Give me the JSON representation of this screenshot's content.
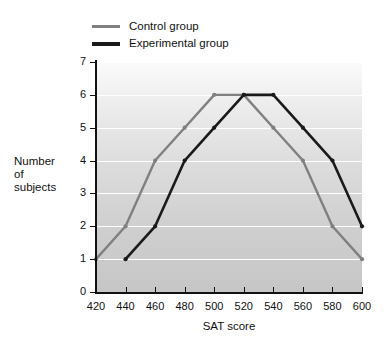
{
  "legend": {
    "position": "top-left",
    "entries": [
      {
        "label": "Control group",
        "color": "#808080",
        "key": "control"
      },
      {
        "label": "Experimental group",
        "color": "#1a1a1a",
        "key": "experimental"
      }
    ]
  },
  "axes": {
    "x_title": "SAT score",
    "y_title_line1": "Number",
    "y_title_line2": "of",
    "y_title_line3": "subjects",
    "x_ticks": [
      "420",
      "440",
      "460",
      "480",
      "500",
      "520",
      "540",
      "560",
      "580",
      "600"
    ],
    "y_ticks": [
      "0",
      "1",
      "2",
      "3",
      "4",
      "5",
      "6",
      "7"
    ]
  },
  "chart_data": {
    "type": "line",
    "title": "",
    "subtitle": "",
    "xlabel": "SAT score",
    "ylabel": "Number of subjects",
    "x": [
      420,
      440,
      460,
      480,
      500,
      520,
      540,
      560,
      580,
      600
    ],
    "xlim": [
      420,
      600
    ],
    "ylim": [
      0,
      7
    ],
    "xticks": [
      420,
      440,
      460,
      480,
      500,
      520,
      540,
      560,
      580,
      600
    ],
    "yticks": [
      0,
      1,
      2,
      3,
      4,
      5,
      6,
      7
    ],
    "grid": "horizontal-only",
    "legend_position": "above-plot-left",
    "series": [
      {
        "name": "Control group",
        "color": "#808080",
        "x": [
          420,
          440,
          460,
          480,
          500,
          520,
          540,
          560,
          580,
          600
        ],
        "values": [
          1,
          2,
          4,
          5,
          6,
          6,
          5,
          4,
          2,
          1
        ]
      },
      {
        "name": "Experimental group",
        "color": "#1a1a1a",
        "x": [
          440,
          460,
          480,
          500,
          520,
          540,
          560,
          580,
          600
        ],
        "values": [
          1,
          2,
          4,
          5,
          6,
          6,
          5,
          4,
          2
        ]
      }
    ]
  }
}
